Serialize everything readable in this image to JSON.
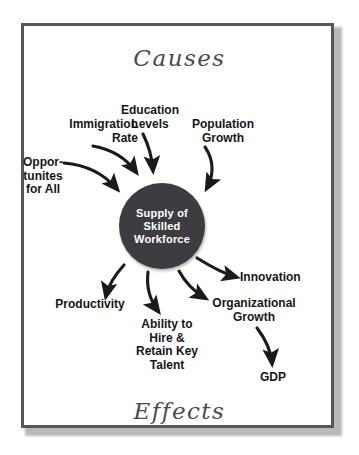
{
  "diagram": {
    "heading_top": "Causes",
    "heading_bottom": "Effects",
    "hub": {
      "label": "Supply  of\nSkilled\nWorkforce",
      "fill_color": "#3d3d41",
      "text_color": "#ffffff"
    },
    "frame": {
      "border_color": "#54565c",
      "background_color": "#ffffff"
    },
    "causes": [
      {
        "id": "immigration",
        "label": "Immigration\nRate"
      },
      {
        "id": "education",
        "label": "Education\nLevels"
      },
      {
        "id": "population",
        "label": "Population\nGrowth"
      },
      {
        "id": "opportunity",
        "label": "Oppor-\ntunites\nfor All"
      }
    ],
    "effects": [
      {
        "id": "productivity",
        "label": "Productivity"
      },
      {
        "id": "ability",
        "label": "Ability to\nHire &\nRetain Key\nTalent"
      },
      {
        "id": "organizational",
        "label": "Organizational\nGrowth"
      },
      {
        "id": "innovation",
        "label": "Innovation"
      },
      {
        "id": "gdp",
        "label": "GDP"
      }
    ],
    "connections": [
      {
        "from": "immigration",
        "to": "hub",
        "direction": "inbound"
      },
      {
        "from": "education",
        "to": "hub",
        "direction": "inbound"
      },
      {
        "from": "population",
        "to": "hub",
        "direction": "inbound"
      },
      {
        "from": "opportunity",
        "to": "hub",
        "direction": "inbound"
      },
      {
        "from": "hub",
        "to": "productivity",
        "direction": "outbound"
      },
      {
        "from": "hub",
        "to": "ability",
        "direction": "outbound"
      },
      {
        "from": "hub",
        "to": "organizational",
        "direction": "outbound"
      },
      {
        "from": "hub",
        "to": "innovation",
        "direction": "outbound"
      },
      {
        "from": "organizational",
        "to": "gdp",
        "direction": "outbound"
      }
    ],
    "arrow_color": "#1a1a1a"
  }
}
